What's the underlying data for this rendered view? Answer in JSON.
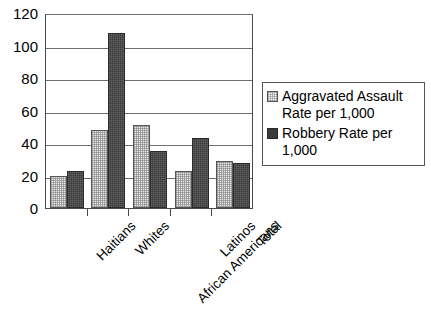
{
  "chart_data": {
    "type": "bar",
    "title": "",
    "subtitle": "",
    "xlabel": "",
    "ylabel": "",
    "categories": [
      "Haitians",
      "Whites",
      "African Americans",
      "Latinos",
      "Total"
    ],
    "series": [
      {
        "name": "Aggravated Assault Rate per 1,000",
        "color": "#e9e9e9",
        "values": [
          20,
          48,
          51,
          23,
          29
        ]
      },
      {
        "name": "Robbery Rate per 1,000",
        "color": "#3a3a3a",
        "values": [
          23,
          108,
          35,
          43,
          28
        ]
      }
    ],
    "ylim": [
      0,
      120
    ],
    "yticks": [
      0,
      20,
      40,
      60,
      80,
      100,
      120
    ],
    "ytick_labels": [
      "0",
      "20",
      "40",
      "60",
      "80",
      "100",
      "120"
    ],
    "grid": true,
    "legend_position": "right"
  },
  "legend": {
    "entries": [
      {
        "label": "Aggravated Assault\nRate per 1,000"
      },
      {
        "label": "Robbery Rate per\n1,000"
      }
    ]
  }
}
